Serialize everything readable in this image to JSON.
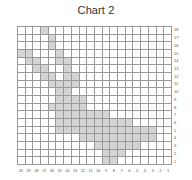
{
  "title": "Chart 2",
  "grid": {
    "columns": 20,
    "rows": 18,
    "fill_color": "#d4d4d4",
    "line_color": "#999999",
    "column_labels": [
      "20",
      "19",
      "18",
      "17",
      "16",
      "15",
      "14",
      "13",
      "12",
      "11",
      "10",
      "9",
      "8",
      "7",
      "6",
      "5",
      "4",
      "3",
      "2",
      "1"
    ],
    "row_labels": [
      "18",
      "17",
      "16",
      "15",
      "14",
      "13",
      "12",
      "11",
      "10",
      "9",
      "8",
      "7",
      "6",
      "5",
      "4",
      "3",
      "2",
      "1"
    ],
    "filled_rows_top_to_bottom": [
      "00010000000000000000",
      "00001000000000000000",
      "00001000000000000000",
      "11000100000000000000",
      "01100110000000000000",
      "00110010000000000000",
      "00011011000000000000",
      "00001111000000000000",
      "00000110000000000000",
      "00000111100000000000",
      "00001111100000000000",
      "00000111111100000000",
      "00000111111111100000",
      "00000111111111111100",
      "00000000111111111100",
      "00000000001111110000",
      "00000000000111000000",
      "00000000000110000000"
    ]
  }
}
